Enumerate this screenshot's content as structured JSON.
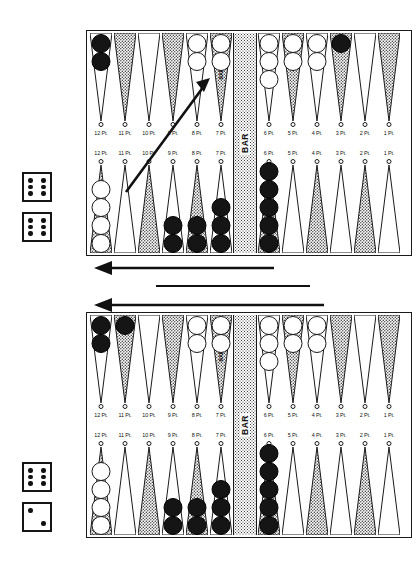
{
  "document": {
    "title": "Backgammon Position Diagram",
    "bar_label": "BAR",
    "point_label_suffix": "Pt."
  },
  "point_labels": {
    "left_quad": [
      "12 Pt.",
      "11 Pt.",
      "10 Pt.",
      "9 Pt.",
      "8 Pt.",
      "7 Pt."
    ],
    "right_quad": [
      "6 Pt.",
      "5 Pt.",
      "4 Pt.",
      "3 Pt.",
      "2 Pt.",
      "1 Pt."
    ]
  },
  "colors": {
    "ink": "#111111",
    "white_checker": "#ffffff",
    "black_checker": "#151515",
    "board_background": "#ffffff",
    "stipple": "#3b3b3b"
  },
  "boards": [
    {
      "id": "board-top",
      "name": "top-board",
      "caption": "Position before the move",
      "top_left_points": [
        {
          "label": "12 Pt.",
          "shaded": false,
          "checkers": {
            "color": "black",
            "count": 2
          }
        },
        {
          "label": "11 Pt.",
          "shaded": true,
          "checkers": {
            "color": "none",
            "count": 0
          }
        },
        {
          "label": "10 Pt.",
          "shaded": false,
          "checkers": {
            "color": "none",
            "count": 0
          }
        },
        {
          "label": "9 Pt.",
          "shaded": true,
          "checkers": {
            "color": "none",
            "count": 0
          }
        },
        {
          "label": "8 Pt.",
          "shaded": false,
          "checkers": {
            "color": "white",
            "count": 2
          }
        },
        {
          "label": "7 Pt.",
          "shaded": true,
          "checkers": {
            "color": "white",
            "count": 2
          },
          "bar_text": "BAR"
        }
      ],
      "top_right_points": [
        {
          "label": "6 Pt.",
          "shaded": false,
          "checkers": {
            "color": "white",
            "count": 3
          }
        },
        {
          "label": "5 Pt.",
          "shaded": true,
          "checkers": {
            "color": "white",
            "count": 2
          }
        },
        {
          "label": "4 Pt.",
          "shaded": false,
          "checkers": {
            "color": "white",
            "count": 2
          }
        },
        {
          "label": "3 Pt.",
          "shaded": true,
          "checkers": {
            "color": "black",
            "count": 1
          }
        },
        {
          "label": "2 Pt.",
          "shaded": false,
          "checkers": {
            "color": "none",
            "count": 0
          }
        },
        {
          "label": "1 Pt.",
          "shaded": true,
          "checkers": {
            "color": "none",
            "count": 0
          }
        }
      ],
      "bottom_left_points": [
        {
          "label": "12 Pt.",
          "shaded": true,
          "checkers": {
            "color": "white",
            "count": 4
          }
        },
        {
          "label": "11 Pt.",
          "shaded": false,
          "checkers": {
            "color": "none",
            "count": 0
          }
        },
        {
          "label": "10 Pt.",
          "shaded": true,
          "checkers": {
            "color": "none",
            "count": 0
          }
        },
        {
          "label": "9 Pt.",
          "shaded": false,
          "checkers": {
            "color": "black",
            "count": 2
          }
        },
        {
          "label": "8 Pt.",
          "shaded": true,
          "checkers": {
            "color": "black",
            "count": 2
          }
        },
        {
          "label": "7 Pt.",
          "shaded": false,
          "checkers": {
            "color": "black",
            "count": 3
          }
        }
      ],
      "bottom_right_points": [
        {
          "label": "6 Pt.",
          "shaded": true,
          "checkers": {
            "color": "black",
            "count": 5
          }
        },
        {
          "label": "5 Pt.",
          "shaded": false,
          "checkers": {
            "color": "none",
            "count": 0
          }
        },
        {
          "label": "4 Pt.",
          "shaded": true,
          "checkers": {
            "color": "none",
            "count": 0
          }
        },
        {
          "label": "3 Pt.",
          "shaded": false,
          "checkers": {
            "color": "none",
            "count": 0
          }
        },
        {
          "label": "2 Pt.",
          "shaded": true,
          "checkers": {
            "color": "none",
            "count": 0
          }
        },
        {
          "label": "1 Pt.",
          "shaded": false,
          "checkers": {
            "color": "none",
            "count": 0
          }
        }
      ],
      "move_arrow": {
        "name": "move-arrow",
        "from_point": "11 Pt.",
        "to_point": "8 Pt.",
        "description": "diagonal arrow from lower 11 point up to upper 8 point"
      }
    },
    {
      "id": "board-bottom",
      "name": "bottom-board",
      "caption": "Position after the move",
      "top_left_points": [
        {
          "label": "12 Pt.",
          "shaded": false,
          "checkers": {
            "color": "black",
            "count": 2
          }
        },
        {
          "label": "11 Pt.",
          "shaded": true,
          "checkers": {
            "color": "black",
            "count": 1
          }
        },
        {
          "label": "10 Pt.",
          "shaded": false,
          "checkers": {
            "color": "none",
            "count": 0
          }
        },
        {
          "label": "9 Pt.",
          "shaded": true,
          "checkers": {
            "color": "none",
            "count": 0
          }
        },
        {
          "label": "8 Pt.",
          "shaded": false,
          "checkers": {
            "color": "white",
            "count": 2
          }
        },
        {
          "label": "7 Pt.",
          "shaded": true,
          "checkers": {
            "color": "white",
            "count": 2
          },
          "bar_text": "BAR"
        }
      ],
      "top_right_points": [
        {
          "label": "6 Pt.",
          "shaded": false,
          "checkers": {
            "color": "white",
            "count": 3
          }
        },
        {
          "label": "5 Pt.",
          "shaded": true,
          "checkers": {
            "color": "white",
            "count": 2
          }
        },
        {
          "label": "4 Pt.",
          "shaded": false,
          "checkers": {
            "color": "white",
            "count": 2
          }
        },
        {
          "label": "3 Pt.",
          "shaded": true,
          "checkers": {
            "color": "none",
            "count": 0
          }
        },
        {
          "label": "2 Pt.",
          "shaded": false,
          "checkers": {
            "color": "none",
            "count": 0
          }
        },
        {
          "label": "1 Pt.",
          "shaded": true,
          "checkers": {
            "color": "none",
            "count": 0
          }
        }
      ],
      "bottom_left_points": [
        {
          "label": "12 Pt.",
          "shaded": true,
          "checkers": {
            "color": "white",
            "count": 4
          }
        },
        {
          "label": "11 Pt.",
          "shaded": false,
          "checkers": {
            "color": "none",
            "count": 0
          }
        },
        {
          "label": "10 Pt.",
          "shaded": true,
          "checkers": {
            "color": "none",
            "count": 0
          }
        },
        {
          "label": "9 Pt.",
          "shaded": false,
          "checkers": {
            "color": "black",
            "count": 2
          }
        },
        {
          "label": "8 Pt.",
          "shaded": true,
          "checkers": {
            "color": "black",
            "count": 2
          }
        },
        {
          "label": "7 Pt.",
          "shaded": false,
          "checkers": {
            "color": "black",
            "count": 3
          }
        }
      ],
      "bottom_right_points": [
        {
          "label": "6 Pt.",
          "shaded": true,
          "checkers": {
            "color": "black",
            "count": 5
          }
        },
        {
          "label": "5 Pt.",
          "shaded": false,
          "checkers": {
            "color": "none",
            "count": 0
          }
        },
        {
          "label": "4 Pt.",
          "shaded": true,
          "checkers": {
            "color": "none",
            "count": 0
          }
        },
        {
          "label": "3 Pt.",
          "shaded": false,
          "checkers": {
            "color": "none",
            "count": 0
          }
        },
        {
          "label": "2 Pt.",
          "shaded": true,
          "checkers": {
            "color": "none",
            "count": 0
          }
        },
        {
          "label": "1 Pt.",
          "shaded": false,
          "checkers": {
            "color": "none",
            "count": 0
          }
        }
      ],
      "move_arrow": null
    }
  ],
  "dice": [
    {
      "name": "die-top-1",
      "belongs_to": "top-board",
      "value": 6
    },
    {
      "name": "die-top-2",
      "belongs_to": "top-board",
      "value": 6
    },
    {
      "name": "die-bottom-1",
      "belongs_to": "bottom-board",
      "value": 6
    },
    {
      "name": "die-bottom-2",
      "belongs_to": "bottom-board",
      "value": 2
    }
  ],
  "direction_arrows": [
    {
      "name": "direction-arrow-upper",
      "direction": "left"
    },
    {
      "name": "divider-line",
      "direction": "none"
    },
    {
      "name": "direction-arrow-lower",
      "direction": "left"
    }
  ]
}
